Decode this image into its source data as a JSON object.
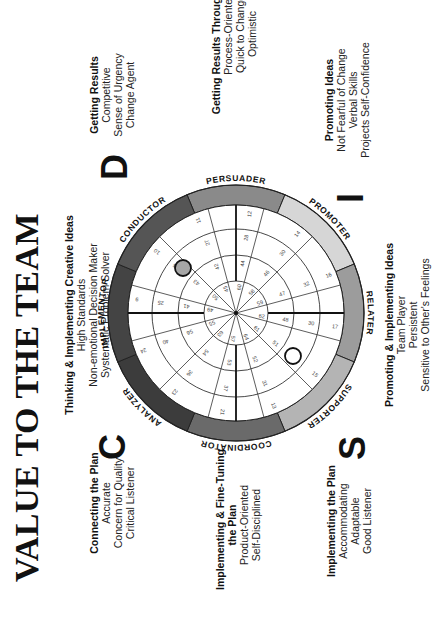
{
  "title": "VALUE TO THE TEAM",
  "quadrant_letters": {
    "D": "D",
    "I": "I",
    "S": "S",
    "C": "C"
  },
  "blocks": {
    "thinking": {
      "heading": "Thinking & Implementing Creative Ideas",
      "lines": [
        "High Standards",
        "Non-emotional Decision Maker",
        "Systematic Problem Solver"
      ]
    },
    "getting_results": {
      "heading": "Getting Results",
      "lines": [
        "Competitive",
        "Sense of Urgency",
        "Change Agent"
      ]
    },
    "getting_results_people": {
      "heading": "Getting Results Through People",
      "lines": [
        "Process-Oriented",
        "Quick to Change",
        "Optimistic"
      ]
    },
    "promoting_ideas": {
      "heading": "Promoting Ideas",
      "lines": [
        "Not Fearful of Change",
        "Verbal Skills",
        "Projects Self-Confidence"
      ]
    },
    "promoting_implementing": {
      "heading": "Promoting & Implementing Ideas",
      "lines": [
        "Team Player",
        "Persistent",
        "Sensitive to Other's Feelings"
      ]
    },
    "implementing_plan": {
      "heading": "Implementing the Plan",
      "lines": [
        "Accommodating",
        "Adaptable",
        "Good Listener"
      ]
    },
    "fine_tuning": {
      "heading": "Implementing & Fine-Tuning the Plan",
      "heading_line2": "the Plan",
      "heading_line1": "Implementing & Fine-Tuning",
      "lines": [
        "Product-Oriented",
        "Self-Disciplined"
      ]
    },
    "connecting_plan": {
      "heading": "Connecting the Plan",
      "lines": [
        "Accurate",
        "Concern for Quality",
        "Critical Listener"
      ]
    }
  },
  "wheel": {
    "segment_labels": [
      "PERSUADER",
      "PROMOTER",
      "RELATER",
      "SUPPORTER",
      "COORDINATOR",
      "ANALYZER",
      "IMPLEMENTOR",
      "CONDUCTOR"
    ],
    "band_colors": [
      "#8a8a8a",
      "#d6d6d6",
      "#9c9c9c",
      "#b4b4b4",
      "#6a6a6a",
      "#3c3c3c",
      "#444444",
      "#555555"
    ],
    "spoke_numbers": {
      "outer": [
        "12",
        "14",
        "16",
        "17",
        "15",
        "13",
        "21",
        "23",
        "24",
        "9",
        "10",
        "11"
      ],
      "ring3": [
        "28",
        "30",
        "32",
        "30",
        "34",
        "31",
        "37",
        "36",
        "40",
        "25",
        "26",
        "27"
      ],
      "ring2": [
        "44",
        "46",
        "47",
        "48",
        "51",
        "52",
        "53",
        "54",
        "56",
        "41",
        "43",
        "42"
      ],
      "ring1": [
        "60",
        "58",
        "59",
        "62",
        "61",
        "64",
        "57",
        "63",
        "55",
        "49",
        "50",
        "45"
      ]
    },
    "markers": [
      {
        "name": "adapted-style-dot",
        "fill": "#a6a6a6",
        "note": "Conductor zone"
      },
      {
        "name": "natural-style-dot",
        "fill": "#ffffff",
        "note": "Supporter/Relater zone"
      }
    ]
  }
}
